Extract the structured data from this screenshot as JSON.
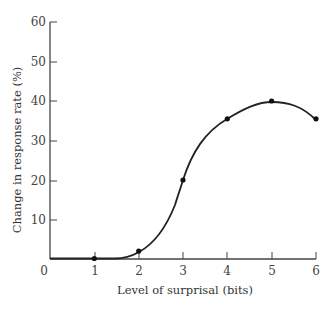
{
  "chart_data": {
    "type": "line",
    "title": "",
    "xlabel": "Level of surprisal (bits)",
    "ylabel": "Change in response rate (%)",
    "x": [
      1,
      2,
      3,
      4,
      5,
      6
    ],
    "series": [
      {
        "name": "Change in response rate",
        "values": [
          0,
          2,
          20,
          35.5,
          40,
          35.5
        ]
      }
    ],
    "xlim": [
      0,
      6
    ],
    "ylim": [
      0,
      60
    ],
    "xticks": [
      "0",
      "1",
      "2",
      "3",
      "4",
      "5",
      "6"
    ],
    "yticks": [
      "10",
      "20",
      "30",
      "40",
      "50",
      "60"
    ],
    "grid": false,
    "legend": null,
    "curve": "smooth S-shaped curve through points, flat near zero from x=0 to ~1.5",
    "line_color": "#222222",
    "axis_color": "#444444"
  }
}
